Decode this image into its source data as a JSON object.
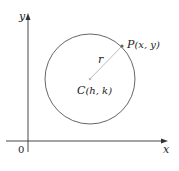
{
  "diagram": {
    "axes": {
      "x_label": "x",
      "y_label": "y",
      "origin_label": "0"
    },
    "circle": {
      "center_label_prefix": "C",
      "center_label_args": "(h, k)",
      "point_label_prefix": "P",
      "point_label_args": "(x, y)",
      "radius_label": "r"
    },
    "colors": {
      "axis": "#333333",
      "circle": "#555555",
      "radius_line": "#bbbbbb",
      "point": "#666666"
    }
  }
}
